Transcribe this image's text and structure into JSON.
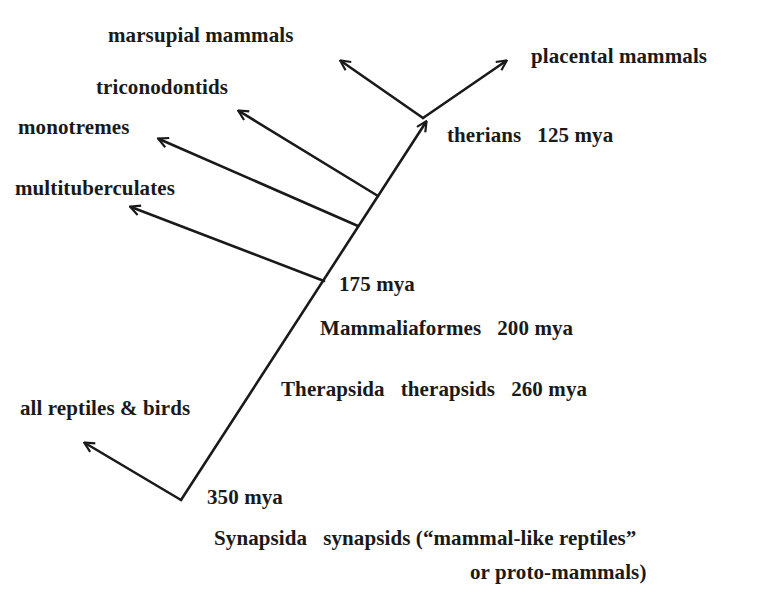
{
  "diagram": {
    "type": "phylogenetic-tree",
    "line_color": "#1a1a1a",
    "text_color": "#1a1a1a",
    "labels": {
      "marsupial": "marsupial mammals",
      "placental": "placental mammals",
      "triconodontids": "triconodontids",
      "monotremes": "monotremes",
      "multituberculates": "multituberculates",
      "therians": "therians   125 mya",
      "node_175": "175 mya",
      "mammaliaformes": "Mammaliaformes   200 mya",
      "therapsida": "Therapsida   therapsids   260 mya",
      "reptiles": "all reptiles & birds",
      "node_350": "350 mya",
      "synapsida_line1": "Synapsida   synapsids (“mammal-like reptiles”",
      "synapsida_line2": "or proto-mammals)"
    },
    "nodes": [
      {
        "name": "Synapsida",
        "common": "synapsids (“mammal-like reptiles” or proto-mammals)",
        "age": "350 mya"
      },
      {
        "name": "Therapsida",
        "common": "therapsids",
        "age": "260 mya"
      },
      {
        "name": "Mammaliaformes",
        "age": "200 mya"
      },
      {
        "name": "",
        "age": "175 mya"
      },
      {
        "name": "therians",
        "age": "125 mya"
      }
    ],
    "leaves": [
      "all reptiles & birds",
      "multituberculates",
      "monotremes",
      "triconodontids",
      "marsupial mammals",
      "placental mammals"
    ]
  }
}
